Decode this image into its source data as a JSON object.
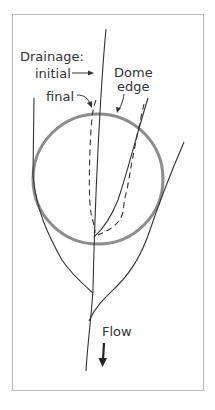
{
  "figure": {
    "labels": {
      "drainage": "Drainage:",
      "initial": "initial",
      "final": "final",
      "dome_line1": "Dome",
      "dome_line2": "edge",
      "flow": "Flow"
    },
    "colors": {
      "frame": "#bbbbbb",
      "dome": "#8c8c8c",
      "stream": "#333333",
      "text": "#333333"
    },
    "legend": {
      "initial_style": "solid",
      "final_style": "dashed"
    }
  }
}
